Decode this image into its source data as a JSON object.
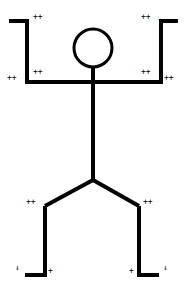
{
  "figure": {
    "stroke_color": "#000000",
    "background": "#ffffff",
    "stroke_width": 4,
    "head": {
      "cx": 93,
      "cy": 48,
      "r": 19
    },
    "segments": {
      "left_hand": {
        "x1": 9,
        "y1": 21,
        "x2": 27,
        "y2": 21
      },
      "left_forearm": {
        "x1": 27,
        "y1": 19,
        "x2": 27,
        "y2": 82
      },
      "shoulders": {
        "x1": 25,
        "y1": 82,
        "x2": 163,
        "y2": 82
      },
      "right_forearm": {
        "x1": 161,
        "y1": 19,
        "x2": 161,
        "y2": 82
      },
      "right_hand": {
        "x1": 159,
        "y1": 21,
        "x2": 178,
        "y2": 21
      },
      "neck_torso": {
        "x1": 93,
        "y1": 67,
        "x2": 93,
        "y2": 180
      },
      "left_thigh": {
        "x1": 93,
        "y1": 180,
        "x2": 45,
        "y2": 206
      },
      "right_thigh": {
        "x1": 93,
        "y1": 180,
        "x2": 139,
        "y2": 206
      },
      "left_shin": {
        "x1": 45,
        "y1": 206,
        "x2": 45,
        "y2": 276
      },
      "right_shin": {
        "x1": 139,
        "y1": 206,
        "x2": 139,
        "y2": 276
      },
      "left_foot": {
        "x1": 25,
        "y1": 275,
        "x2": 47,
        "y2": 275
      },
      "right_foot": {
        "x1": 137,
        "y1": 275,
        "x2": 159,
        "y2": 275
      }
    }
  },
  "markers": [
    {
      "id": "left-hand-top",
      "text": "++",
      "x": 33,
      "y": 17
    },
    {
      "id": "right-hand-top",
      "text": "++",
      "x": 141,
      "y": 17
    },
    {
      "id": "left-elbow",
      "text": "++",
      "x": 33,
      "y": 72
    },
    {
      "id": "right-elbow",
      "text": "++",
      "x": 141,
      "y": 72
    },
    {
      "id": "left-shoulder-outer",
      "text": "++",
      "x": 7,
      "y": 78
    },
    {
      "id": "right-shoulder-outer",
      "text": "++",
      "x": 164,
      "y": 78
    },
    {
      "id": "left-knee",
      "text": "++",
      "x": 26,
      "y": 202
    },
    {
      "id": "right-knee",
      "text": "++",
      "x": 143,
      "y": 202
    },
    {
      "id": "left-ankle",
      "text": "+",
      "x": 48,
      "y": 271
    },
    {
      "id": "right-ankle",
      "text": "+",
      "x": 129,
      "y": 271
    },
    {
      "id": "left-toe",
      "text": "↓",
      "x": 15,
      "y": 268
    },
    {
      "id": "right-toe",
      "text": "↓",
      "x": 163,
      "y": 268
    }
  ]
}
